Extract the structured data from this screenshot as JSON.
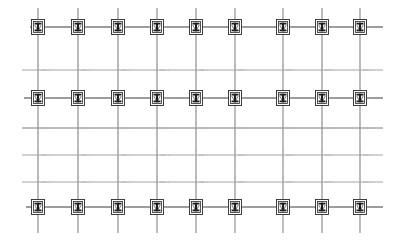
{
  "drawing": {
    "title": "Structural Column Grid Framing Plan",
    "type": "cad-structural-plan",
    "canvas": {
      "width": 397,
      "height": 240,
      "background": "#ffffff"
    },
    "colors": {
      "beam_primary": "#3a3a3a",
      "beam_secondary": "#6e6e6e",
      "beam_faint": "#9a9a9a",
      "column_line": "#8c8c8c",
      "centerline": "#b0b0b0",
      "symbol_outline": "#2b2b2b",
      "symbol_fill": "#ffffff",
      "symbol_inner": "#1e1e1e"
    },
    "grid": {
      "column_axes_label": "Column Axes",
      "column_axes_x": [
        38,
        78,
        118,
        157,
        196,
        235,
        283,
        322,
        360
      ],
      "column_axis_names": [
        "1",
        "2",
        "3",
        "4",
        "5",
        "6",
        "7",
        "8",
        "9"
      ],
      "column_line_top": 8,
      "column_line_bottom": 233,
      "beam_axes_label": "Beam Axes",
      "beam_rows": [
        {
          "name": "A",
          "y": 27,
          "weight": 1.1,
          "tone": "beam_primary",
          "x_start": 30,
          "x_end": 383,
          "has_columns": true
        },
        {
          "name": "B",
          "y": 70,
          "weight": 0.9,
          "tone": "beam_faint",
          "x_start": 22,
          "x_end": 383,
          "has_columns": false
        },
        {
          "name": "C",
          "y": 98,
          "weight": 1.1,
          "tone": "beam_primary",
          "x_start": 24,
          "x_end": 383,
          "has_columns": true
        },
        {
          "name": "D",
          "y": 128,
          "weight": 0.9,
          "tone": "beam_secondary",
          "x_start": 22,
          "x_end": 383,
          "has_columns": false
        },
        {
          "name": "E",
          "y": 155,
          "weight": 0.9,
          "tone": "beam_faint",
          "x_start": 22,
          "x_end": 383,
          "has_columns": false
        },
        {
          "name": "F",
          "y": 182,
          "weight": 0.9,
          "tone": "beam_faint",
          "x_start": 22,
          "x_end": 383,
          "has_columns": false
        },
        {
          "name": "G",
          "y": 207,
          "weight": 1.1,
          "tone": "beam_primary",
          "x_start": 26,
          "x_end": 383,
          "has_columns": true
        }
      ],
      "column_rows_y": [
        27,
        98,
        207
      ],
      "column_count_per_row": 9,
      "column_row_count": 3,
      "column_total": 27
    },
    "column_symbol": {
      "name": "steel-h-column",
      "outer_width": 13,
      "outer_height": 15,
      "inner_width": 9,
      "inner_height": 11,
      "web_width": 2.2,
      "flange_height": 1.8,
      "description": "Square column cap with H-section steel profile"
    },
    "centerline": {
      "name": "axis-centerline",
      "dash_pattern": "6 2 1.5 2",
      "stub_length": 9
    }
  }
}
